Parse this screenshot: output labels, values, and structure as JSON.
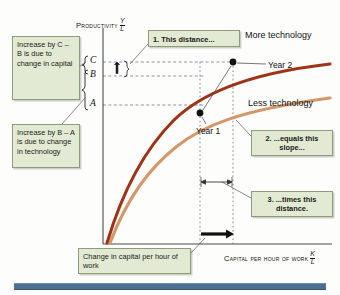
{
  "figure": {
    "top_strip_text": "",
    "bottom_rule_color": "#4d6f92"
  },
  "axes": {
    "y_label": "Productivity",
    "y_ratio_num": "Y",
    "y_ratio_den": "L",
    "x_label": "Capital per hour of work",
    "x_ratio_num": "K",
    "x_ratio_den": "L",
    "ticks": [
      {
        "name": "tick-C",
        "label": "C",
        "y_value": 62
      },
      {
        "name": "tick-B",
        "label": "B",
        "y_value": 76
      },
      {
        "name": "tick-A",
        "label": "A",
        "y_value": 105
      }
    ]
  },
  "curves": [
    {
      "name": "more-technology",
      "label": "More technology",
      "color": "#9e3417"
    },
    {
      "name": "less-technology",
      "label": "Less technology",
      "color": "#d2976a"
    }
  ],
  "points": [
    {
      "name": "year-1-point",
      "label": "Year 1",
      "x": 200,
      "y": 113,
      "on_curve": "less-technology"
    },
    {
      "name": "year-2-point",
      "label": "Year 2",
      "x": 233,
      "y": 64,
      "on_curve": "more-technology"
    }
  ],
  "callouts": {
    "capital": {
      "lines": [
        "Increase",
        "by C – B",
        "is due to",
        "change in",
        "capital"
      ],
      "text": "Increase by C – B is due to change in capital"
    },
    "technology": {
      "lines": [
        "Increase by",
        "B – A is due",
        "to change in",
        "technology"
      ],
      "text": "Increase by B – A is due to change in technology"
    },
    "step1": {
      "text": "1. This distance..."
    },
    "step2": {
      "text": "2. ...equals this slope..."
    },
    "step3": {
      "text": "3. ...times this distance."
    },
    "change_capital": {
      "text": "Change in capital per hour of work"
    }
  },
  "colors": {
    "callout_fill": "#e3ead3",
    "callout_border": "#8e9b7c",
    "more_tech": "#9e3417",
    "less_tech": "#d2976a",
    "axis": "#555555",
    "guide": "#6f7b8a",
    "blue_rule": "#4d6f92"
  }
}
